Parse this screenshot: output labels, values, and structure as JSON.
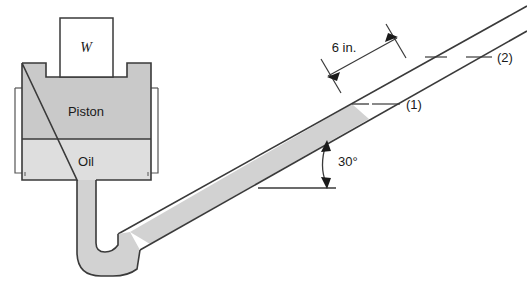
{
  "figure": {
    "labels": {
      "weight": "W",
      "piston": "Piston",
      "oil": "Oil",
      "dimension_length": "6 in.",
      "angle": "30°",
      "point_1": "(1)",
      "point_2": "(2)"
    },
    "colors": {
      "piston_fill": "#c9c9c9",
      "oil_fill": "#dedede",
      "tube_fill": "#d2d2d2",
      "outline": "#3a3a3a",
      "thin_outline": "#555555",
      "text": "#1a1a1a",
      "background": "#ffffff"
    },
    "geometry": {
      "incline_angle_degrees": 30,
      "dimension_value": 6,
      "dimension_units": "in."
    }
  }
}
